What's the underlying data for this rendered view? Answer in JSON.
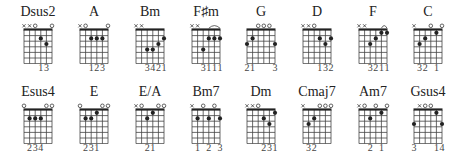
{
  "chart_data": {
    "type": "chord-diagrams",
    "strings_order": "low E (left) to high e (right)",
    "chords": [
      {
        "name": "Dsus2",
        "top": [
          "x",
          "x",
          "o",
          "",
          "",
          "o"
        ],
        "dots": [
          [
            3,
            2
          ],
          [
            4,
            3
          ]
        ],
        "barre": null,
        "fingering": [
          "",
          "",
          "",
          "1",
          "3",
          ""
        ]
      },
      {
        "name": "A",
        "top": [
          "x",
          "o",
          "",
          "",
          "",
          "o"
        ],
        "dots": [
          [
            2,
            2
          ],
          [
            3,
            2
          ],
          [
            4,
            2
          ]
        ],
        "barre": null,
        "fingering": [
          "",
          "",
          "1",
          "2",
          "3",
          ""
        ]
      },
      {
        "name": "Bm",
        "top": [
          "x",
          "x",
          "",
          "",
          "",
          ""
        ],
        "dots": [
          [
            2,
            4
          ],
          [
            3,
            4
          ],
          [
            4,
            3
          ],
          [
            5,
            2
          ]
        ],
        "barre": null,
        "fingering": [
          "",
          "",
          "3",
          "4",
          "2",
          "1"
        ]
      },
      {
        "name": "F♯m",
        "top": [
          "x",
          "x",
          "",
          "",
          "",
          ""
        ],
        "dots": [
          [
            2,
            4
          ],
          [
            3,
            2
          ],
          [
            4,
            2
          ],
          [
            5,
            2
          ]
        ],
        "barre": [
          3,
          5
        ],
        "fingering": [
          "",
          "",
          "3",
          "1",
          "1",
          "1"
        ]
      },
      {
        "name": "G",
        "top": [
          "",
          "",
          "o",
          "o",
          "o",
          ""
        ],
        "dots": [
          [
            0,
            3
          ],
          [
            1,
            2
          ],
          [
            5,
            3
          ]
        ],
        "barre": null,
        "fingering": [
          "2",
          "1",
          "",
          "",
          "",
          "3"
        ]
      },
      {
        "name": "D",
        "top": [
          "x",
          "x",
          "o",
          "",
          "",
          ""
        ],
        "dots": [
          [
            3,
            2
          ],
          [
            4,
            3
          ],
          [
            5,
            2
          ]
        ],
        "barre": null,
        "fingering": [
          "",
          "",
          "",
          "1",
          "3",
          "2"
        ]
      },
      {
        "name": "F",
        "top": [
          "x",
          "x",
          "",
          "",
          "",
          ""
        ],
        "dots": [
          [
            2,
            3
          ],
          [
            3,
            2
          ],
          [
            4,
            1
          ],
          [
            5,
            1
          ]
        ],
        "barre": [
          4,
          5
        ],
        "fingering": [
          "",
          "",
          "3",
          "2",
          "1",
          "1"
        ]
      },
      {
        "name": "C",
        "top": [
          "x",
          "",
          "",
          "o",
          "",
          "o"
        ],
        "dots": [
          [
            1,
            3
          ],
          [
            2,
            2
          ],
          [
            4,
            1
          ]
        ],
        "barre": null,
        "fingering": [
          "",
          "3",
          "2",
          "",
          "1",
          ""
        ]
      },
      {
        "name": "Esus4",
        "top": [
          "o",
          "",
          "",
          "",
          "o",
          "o"
        ],
        "dots": [
          [
            1,
            2
          ],
          [
            2,
            2
          ],
          [
            3,
            2
          ]
        ],
        "barre": null,
        "fingering": [
          "",
          "2",
          "3",
          "4",
          "",
          ""
        ]
      },
      {
        "name": "E",
        "top": [
          "o",
          "",
          "",
          "",
          "o",
          "o"
        ],
        "dots": [
          [
            1,
            2
          ],
          [
            2,
            2
          ],
          [
            3,
            1
          ]
        ],
        "barre": null,
        "fingering": [
          "",
          "2",
          "3",
          "1",
          "",
          ""
        ]
      },
      {
        "name": "E/A",
        "top": [
          "x",
          "o",
          "",
          "",
          "o",
          "o"
        ],
        "dots": [
          [
            2,
            2
          ],
          [
            3,
            1
          ]
        ],
        "barre": null,
        "fingering": [
          "",
          "",
          "2",
          "1",
          "",
          ""
        ]
      },
      {
        "name": "Bm7",
        "top": [
          "x",
          "",
          "o",
          "",
          "o",
          ""
        ],
        "dots": [
          [
            1,
            2
          ],
          [
            3,
            2
          ],
          [
            5,
            2
          ]
        ],
        "barre": null,
        "fingering": [
          "",
          "1",
          "",
          "2",
          "",
          "3"
        ]
      },
      {
        "name": "Dm",
        "top": [
          "x",
          "x",
          "o",
          "",
          "",
          ""
        ],
        "dots": [
          [
            3,
            2
          ],
          [
            4,
            3
          ],
          [
            5,
            1
          ]
        ],
        "barre": null,
        "fingering": [
          "",
          "",
          "",
          "2",
          "3",
          "1"
        ]
      },
      {
        "name": "Cmaj7",
        "top": [
          "x",
          "",
          "",
          "o",
          "o",
          "o"
        ],
        "dots": [
          [
            1,
            3
          ],
          [
            2,
            2
          ]
        ],
        "barre": null,
        "fingering": [
          "",
          "3",
          "2",
          "",
          "",
          ""
        ]
      },
      {
        "name": "Am7",
        "top": [
          "x",
          "o",
          "",
          "o",
          "",
          "o"
        ],
        "dots": [
          [
            2,
            2
          ],
          [
            4,
            1
          ]
        ],
        "barre": null,
        "fingering": [
          "",
          "",
          "2",
          "",
          "1",
          ""
        ]
      },
      {
        "name": "Gsus4",
        "top": [
          "",
          "x",
          "o",
          "o",
          "",
          ""
        ],
        "dots": [
          [
            0,
            3
          ],
          [
            4,
            1
          ],
          [
            5,
            3
          ]
        ],
        "barre": null,
        "fingering": [
          "3",
          "",
          "",
          "",
          "1",
          "4"
        ]
      }
    ]
  },
  "colors": {
    "ink": "#222222",
    "grid": "#444444",
    "background": "#ffffff"
  }
}
